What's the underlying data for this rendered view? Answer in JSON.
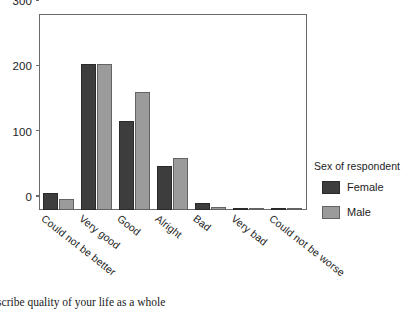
{
  "chart_data": {
    "type": "bar",
    "title": "",
    "subtitle": "",
    "xlabel": "",
    "ylabel": "",
    "categories": [
      "Could not be better",
      "Very good",
      "Good",
      "Alright",
      "Bad",
      "Very bad",
      "Could not be worse"
    ],
    "series": [
      {
        "name": "Female",
        "color": "#3d3d3d",
        "values": [
          26,
          224,
          136,
          67,
          10,
          2,
          1
        ]
      },
      {
        "name": "Male",
        "color": "#9b9b9b",
        "values": [
          17,
          223,
          180,
          80,
          4,
          1,
          3
        ]
      }
    ],
    "ylim": [
      0,
      300
    ],
    "yticks": [
      0,
      100,
      200,
      300
    ],
    "ytick_labels": [
      "0",
      "100",
      "200",
      "300"
    ],
    "grid": false,
    "legend_position": "right",
    "legend_title": "Sex of respondent",
    "annotations": []
  },
  "axes": {
    "y_ticks": [
      {
        "value": 300,
        "label": "300"
      },
      {
        "value": 200,
        "label": "200"
      },
      {
        "value": 100,
        "label": "100"
      },
      {
        "value": 0,
        "label": "0"
      }
    ],
    "x_categories": [
      {
        "label": "Could not be better"
      },
      {
        "label": "Very good"
      },
      {
        "label": "Good"
      },
      {
        "label": "Alright"
      },
      {
        "label": "Bad"
      },
      {
        "label": "Very bad"
      },
      {
        "label": "Could not be worse"
      }
    ]
  },
  "legend": {
    "title": "Sex of respondent",
    "entries": [
      {
        "label": "Female",
        "color": "#3d3d3d"
      },
      {
        "label": "Male",
        "color": "#9b9b9b"
      }
    ]
  },
  "caption": {
    "text": "escribe quality of your life as a whole"
  }
}
